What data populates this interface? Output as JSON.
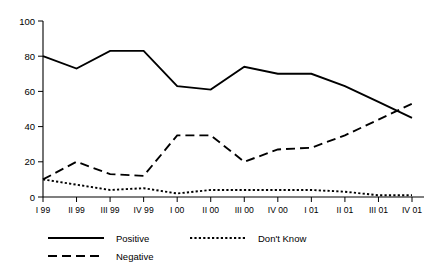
{
  "chart_data": {
    "type": "line",
    "title": "",
    "xlabel": "",
    "ylabel": "",
    "ylim": [
      0,
      100
    ],
    "yticks": [
      0,
      20,
      40,
      60,
      80,
      100
    ],
    "grid": false,
    "legend_position": "bottom",
    "categories": [
      "I 99",
      "II 99",
      "III 99",
      "IV 99",
      "I 00",
      "II 00",
      "III 00",
      "IV 00",
      "I 01",
      "II 01",
      "III 01",
      "IV 01"
    ],
    "series": [
      {
        "name": "Positive",
        "style": "solid",
        "values": [
          80,
          73,
          83,
          83,
          63,
          61,
          74,
          70,
          70,
          63,
          54,
          45
        ]
      },
      {
        "name": "Negative",
        "style": "dashed",
        "values": [
          10,
          20,
          13,
          12,
          35,
          35,
          20,
          27,
          28,
          35,
          44,
          53
        ]
      },
      {
        "name": "Don't Know",
        "style": "dotted",
        "values": [
          10,
          7,
          4,
          5,
          2,
          4,
          4,
          4,
          4,
          3,
          1,
          1
        ]
      }
    ]
  },
  "axis": {
    "y_tick_labels": [
      "100",
      "80",
      "60",
      "40",
      "20",
      "0"
    ],
    "x_tick_labels": [
      "I 99",
      "II 99",
      "III 99",
      "IV 99",
      "I 00",
      "II 00",
      "III 00",
      "IV 00",
      "I 01",
      "II 01",
      "III 01",
      "IV 01"
    ]
  },
  "legend": {
    "items": [
      {
        "label": "Positive",
        "style": "solid"
      },
      {
        "label": "Don't Know",
        "style": "dotted"
      },
      {
        "label": "Negative",
        "style": "dashed"
      }
    ]
  },
  "colors": {
    "ink": "#000000",
    "background": "#ffffff"
  }
}
